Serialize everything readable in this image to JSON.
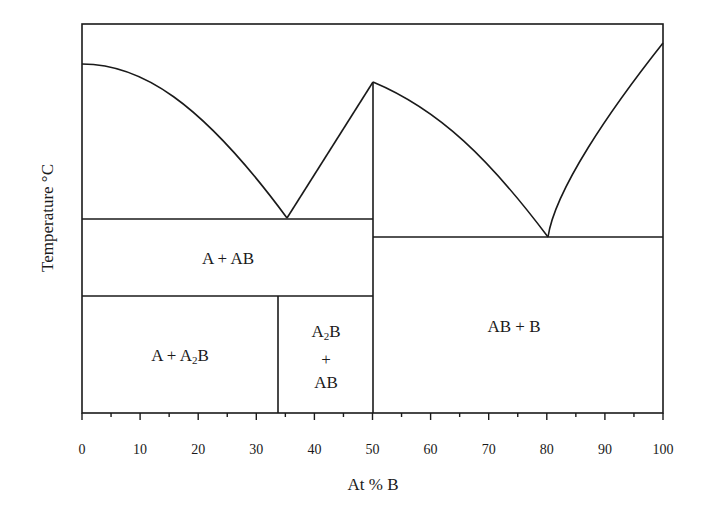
{
  "chart_data": {
    "type": "phase-diagram",
    "title": "",
    "xlabel": "At % B",
    "ylabel": "Temperature °C",
    "xlim": [
      0,
      100
    ],
    "x_ticks": [
      "0",
      "10",
      "20",
      "30",
      "40",
      "50",
      "60",
      "70",
      "80",
      "90",
      "100"
    ],
    "x_minor_ticks_every": 5,
    "y_ticks": [],
    "grid": false,
    "compounds": [
      {
        "name": "A2B",
        "composition": 33.3,
        "melting": "incongruent (peritectic)"
      },
      {
        "name": "AB",
        "composition": 50,
        "melting": "congruent"
      }
    ],
    "invariant_points": [
      {
        "type": "eutectic",
        "composition": 35,
        "phases": "L = A + AB"
      },
      {
        "type": "eutectic",
        "composition": 80,
        "phases": "L = AB + B"
      },
      {
        "type": "congruent_maximum",
        "composition": 50,
        "phase": "AB"
      }
    ],
    "curves": [
      {
        "name": "liquidus-A",
        "from_pct": 0,
        "to_pct": 35
      },
      {
        "name": "liquidus-AB-left",
        "from_pct": 35,
        "to_pct": 50
      },
      {
        "name": "liquidus-AB-right",
        "from_pct": 50,
        "to_pct": 80
      },
      {
        "name": "liquidus-B",
        "from_pct": 80,
        "to_pct": 100
      }
    ],
    "horizontal_lines": [
      {
        "name": "eutectic-1",
        "from_pct": 0,
        "to_pct": 50
      },
      {
        "name": "A2B-decomposition",
        "from_pct": 0,
        "to_pct": 50
      },
      {
        "name": "eutectic-2",
        "from_pct": 50,
        "to_pct": 100
      }
    ],
    "regions": [
      {
        "label": "A + AB"
      },
      {
        "label": "A + A2B"
      },
      {
        "label": "A2B + AB"
      },
      {
        "label": "AB + B"
      }
    ]
  },
  "labels": {
    "x_axis": "At % B",
    "y_axis": "Temperature °C",
    "region_a_ab": "A + AB",
    "region_a_a2b_prefix": "A + A",
    "region_a_a2b_sub": "2",
    "region_a_a2b_suffix": "B",
    "region_a2b_ab_line1_prefix": "A",
    "region_a2b_ab_line1_sub": "2",
    "region_a2b_ab_line1_suffix": "B",
    "region_a2b_ab_line2": "+",
    "region_a2b_ab_line3": "AB",
    "region_ab_b": "AB + B"
  },
  "colors": {
    "line": "#1a1a1a",
    "background": "#ffffff"
  }
}
